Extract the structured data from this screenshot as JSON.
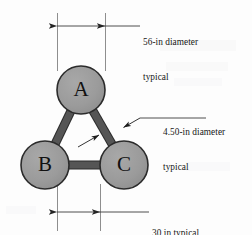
{
  "figure": {
    "background_color": "#fdfdfd",
    "ink_color": "#161616",
    "sphere_fill": "#9a9a9a",
    "sphere_stroke": "#2b2b2b",
    "rod_fill": "#555555",
    "rod_stroke": "#2b2b2b",
    "dimension_line_color": "#3a3a3a",
    "extension_line_color": "#8e8e8e"
  },
  "nodes": [
    {
      "id": "A",
      "label": "A",
      "cx": 81,
      "cy": 90,
      "r": 24
    },
    {
      "id": "B",
      "label": "B",
      "cx": 45,
      "cy": 165,
      "r": 24
    },
    {
      "id": "C",
      "label": "C",
      "cx": 124,
      "cy": 165,
      "r": 24
    }
  ],
  "rods": [
    {
      "from": "A",
      "to": "B",
      "width": 7
    },
    {
      "from": "A",
      "to": "C",
      "width": 7
    },
    {
      "from": "B",
      "to": "C",
      "width": 7
    }
  ],
  "annotations": {
    "sphere_diameter": {
      "line1": "56-in diameter",
      "line2": "typical",
      "value": "56",
      "units": "in",
      "qualifier": "typical",
      "applies_to": "sphere"
    },
    "rod_diameter": {
      "line1": "4.50-in diameter",
      "line2": "typical",
      "value": "4.50",
      "units": "in",
      "qualifier": "typical",
      "applies_to": "rod"
    },
    "spacing": {
      "line1": "30 in typical",
      "value": "30",
      "units": "in",
      "qualifier": "typical",
      "applies_to": "center-to-center spacing"
    }
  },
  "dimensions": {
    "top": {
      "label": "sphere-diameter-dimension",
      "extension_x_left": 57,
      "extension_x_right": 105,
      "extension_y_top": 13,
      "extension_y_bottom": 71,
      "arrow_y": 26,
      "leader_x_end": 140
    },
    "bottom": {
      "label": "spacing-dimension",
      "extension_x_left": 57,
      "extension_x_right": 100,
      "extension_y_top": 184,
      "extension_y_bottom": 231,
      "arrow_y": 212,
      "leader_x_end": 149
    },
    "rod_leader": {
      "label": "rod-diameter-leader",
      "arrow1_tip_x": 122,
      "arrow1_tip_y": 128,
      "arrow2_tip_x": 100,
      "arrow2_tip_y": 136,
      "elbow_x": 140,
      "elbow_y": 118,
      "leader_x_end": 206
    }
  }
}
